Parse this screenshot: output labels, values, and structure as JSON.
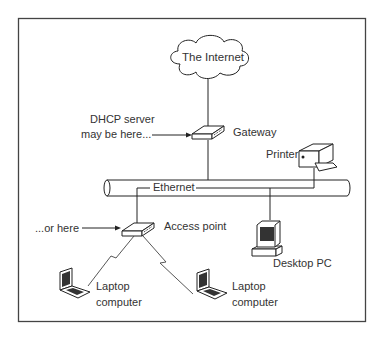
{
  "diagram": {
    "nodes": {
      "internet": {
        "label": "The Internet",
        "icon": "cloud-icon"
      },
      "gateway": {
        "label": "Gateway",
        "icon": "router-icon"
      },
      "printer": {
        "label": "Printer",
        "icon": "printer-icon"
      },
      "ethernet": {
        "label": "Ethernet",
        "icon": "bus-cable-icon"
      },
      "access_point": {
        "label": "Access point",
        "icon": "router-icon"
      },
      "desktop": {
        "label": "Desktop PC",
        "icon": "desktop-pc-icon"
      },
      "laptop1": {
        "label_line1": "Laptop",
        "label_line2": "computer",
        "icon": "laptop-icon"
      },
      "laptop2": {
        "label_line1": "Laptop",
        "label_line2": "computer",
        "icon": "laptop-icon"
      }
    },
    "annotations": {
      "dhcp_line1": "DHCP server",
      "dhcp_line2": "may be here...",
      "or_here": "...or here"
    },
    "edges": [
      {
        "from": "internet",
        "to": "gateway",
        "type": "wired"
      },
      {
        "from": "gateway",
        "to": "ethernet",
        "type": "wired"
      },
      {
        "from": "printer",
        "to": "ethernet",
        "type": "wired"
      },
      {
        "from": "desktop",
        "to": "ethernet",
        "type": "wired"
      },
      {
        "from": "access_point",
        "to": "ethernet",
        "type": "wired"
      },
      {
        "from": "access_point",
        "to": "laptop1",
        "type": "wireless"
      },
      {
        "from": "access_point",
        "to": "laptop2",
        "type": "wireless"
      }
    ]
  }
}
